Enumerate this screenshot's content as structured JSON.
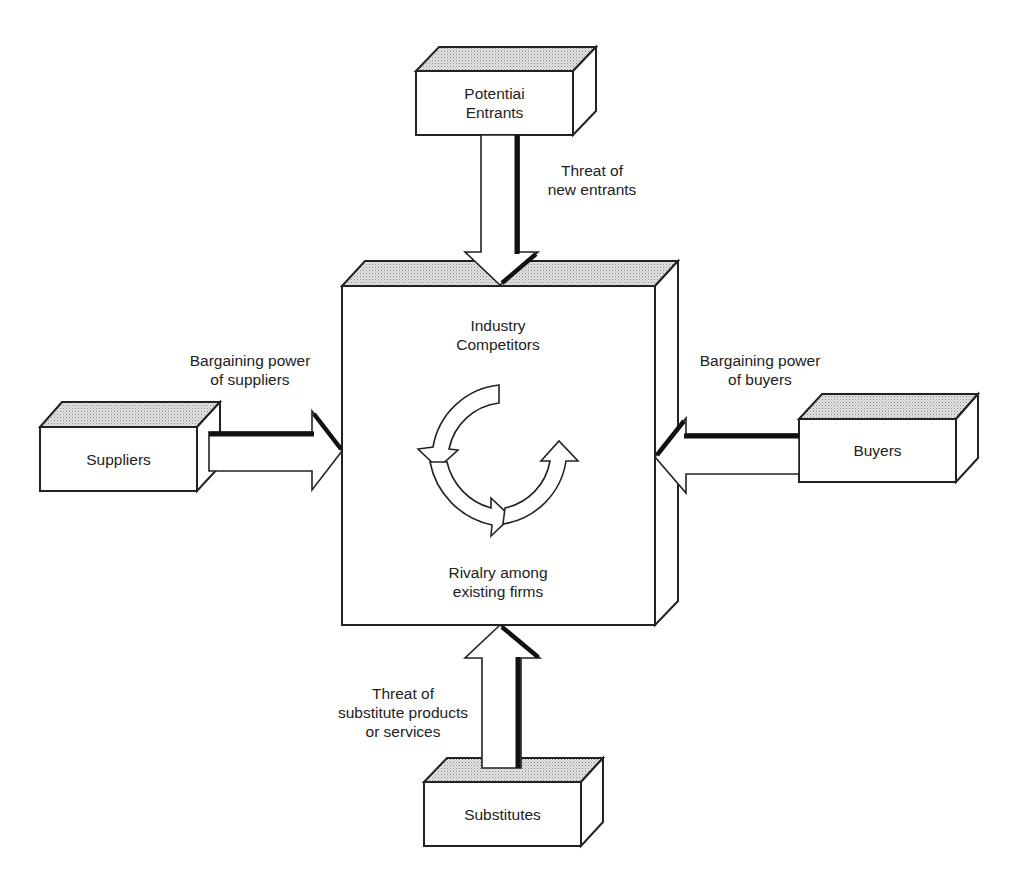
{
  "diagram": {
    "boxes": {
      "center": {
        "line1": "Industry",
        "line2": "Competitors",
        "bottom1": "Rivalry among",
        "bottom2": "existing firms"
      },
      "top": {
        "line1": "Potentiai",
        "line2": "Entrants"
      },
      "left": {
        "label": "Suppliers"
      },
      "right": {
        "label": "Buyers"
      },
      "bottom": {
        "label": "Substitutes"
      }
    },
    "arrows": {
      "top": {
        "line1": "Threat of",
        "line2": "new entrants"
      },
      "left": {
        "line1": "Bargaining power",
        "line2": "of suppliers"
      },
      "right": {
        "line1": "Bargaining power",
        "line2": "of buyers"
      },
      "bottom": {
        "line1": "Threat of",
        "line2": "substitute products",
        "line3": "or services"
      }
    },
    "colors": {
      "stroke": "#222222",
      "fill": "#ffffff",
      "top_face_stipple": "#c8c8c8"
    }
  }
}
